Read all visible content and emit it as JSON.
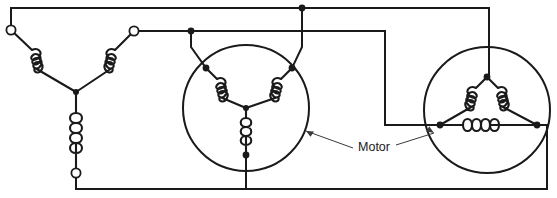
{
  "diagram": {
    "type": "electrical-schematic",
    "canvas": {
      "width": 557,
      "height": 198,
      "background": "#ffffff"
    },
    "line_color": "#1a1a1a",
    "leader_color": "#3a3a3a",
    "labels": [
      {
        "id": "motor-label",
        "text": "Motor",
        "x": 372,
        "y": 148
      }
    ],
    "source": {
      "name": "wye-source",
      "configuration": "wye",
      "center": {
        "x": 76,
        "y": 92
      },
      "terminals": [
        {
          "id": "source-terminal-a",
          "x": 11,
          "y": 30,
          "marker": "open-circle"
        },
        {
          "id": "source-terminal-b",
          "x": 134,
          "y": 31,
          "marker": "open-circle"
        },
        {
          "id": "source-terminal-c",
          "x": 76,
          "y": 173,
          "marker": "open-circle"
        }
      ],
      "coils": [
        {
          "id": "source-coil-a",
          "from": "terminal-a",
          "to": "center",
          "turns": 4
        },
        {
          "id": "source-coil-b",
          "from": "terminal-b",
          "to": "center",
          "turns": 4
        },
        {
          "id": "source-coil-c",
          "from": "center",
          "to": "terminal-c",
          "turns": 5
        }
      ]
    },
    "motors": [
      {
        "id": "motor-wye",
        "name": "wye-connected-motor",
        "configuration": "wye",
        "circle": {
          "cx": 246,
          "cy": 108,
          "r": 63
        },
        "star_center": {
          "x": 246,
          "y": 108
        },
        "terminals": [
          {
            "id": "wye-motor-terminal-left",
            "x": 206,
            "y": 68,
            "marker": "dot"
          },
          {
            "id": "wye-motor-terminal-right",
            "x": 292,
            "y": 68,
            "marker": "dot"
          },
          {
            "id": "wye-motor-terminal-bottom",
            "x": 246,
            "y": 155,
            "marker": "dot"
          }
        ],
        "coils": [
          {
            "id": "wye-motor-coil-left",
            "turns": 4
          },
          {
            "id": "wye-motor-coil-right",
            "turns": 4
          },
          {
            "id": "wye-motor-coil-bottom",
            "turns": 5
          }
        ]
      },
      {
        "id": "motor-delta",
        "name": "delta-connected-motor",
        "configuration": "delta",
        "circle": {
          "cx": 487,
          "cy": 110,
          "r": 63
        },
        "terminals": [
          {
            "id": "delta-motor-terminal-top",
            "x": 487,
            "y": 77,
            "marker": "dot"
          },
          {
            "id": "delta-motor-terminal-left",
            "x": 440,
            "y": 125,
            "marker": "dot"
          },
          {
            "id": "delta-motor-terminal-right",
            "x": 537,
            "y": 125,
            "marker": "dot"
          }
        ],
        "coils": [
          {
            "id": "delta-motor-coil-upper-left",
            "turns": 4
          },
          {
            "id": "delta-motor-coil-upper-right",
            "turns": 4
          },
          {
            "id": "delta-motor-coil-bottom",
            "turns": 5
          }
        ]
      }
    ],
    "junctions": [
      {
        "id": "junction-top-line",
        "x": 302,
        "y": 8
      },
      {
        "id": "junction-second-line",
        "x": 191,
        "y": 31
      },
      {
        "id": "junction-motor-bottom",
        "x": 246,
        "y": 155
      },
      {
        "id": "junction-delta-left",
        "x": 440,
        "y": 125
      },
      {
        "id": "junction-delta-right",
        "x": 537,
        "y": 125
      },
      {
        "id": "junction-delta-top",
        "x": 487,
        "y": 77
      }
    ],
    "bus_lines": {
      "top_line_y": 8,
      "second_line_y": 31,
      "bottom_line_y": 189,
      "left_edge_x": 11,
      "right_edge_x": 547
    }
  }
}
